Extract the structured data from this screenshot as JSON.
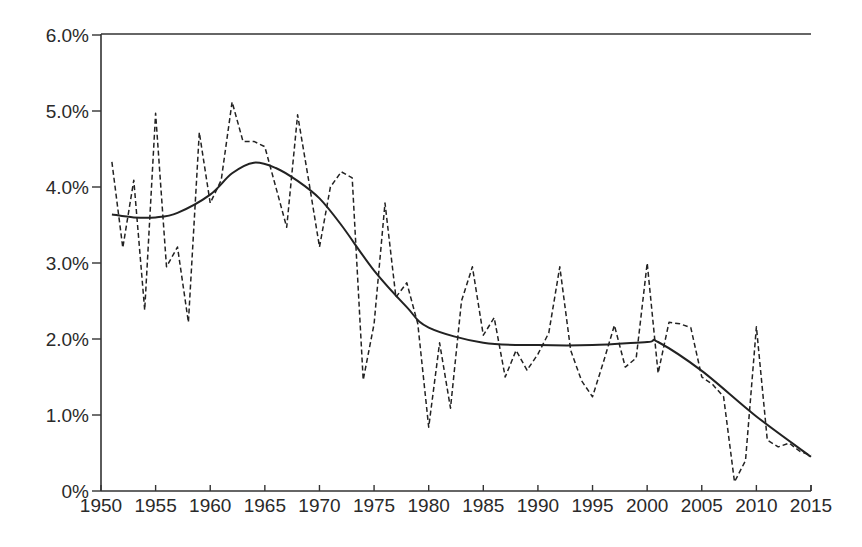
{
  "chart_data": {
    "type": "line",
    "title": "",
    "xlabel": "",
    "ylabel": "",
    "xlim": [
      1950,
      2015
    ],
    "ylim": [
      0,
      6.0
    ],
    "grid": false,
    "legend": null,
    "x_ticks": [
      1950,
      1955,
      1960,
      1965,
      1970,
      1975,
      1980,
      1985,
      1990,
      1995,
      2000,
      2005,
      2010,
      2015
    ],
    "x_tick_labels": [
      "1950",
      "1955",
      "1960",
      "1965",
      "1970",
      "1975",
      "1980",
      "1985",
      "1990",
      "1995",
      "2000",
      "2005",
      "2010",
      "2015"
    ],
    "y_ticks": [
      0,
      1,
      2,
      3,
      4,
      5,
      6
    ],
    "y_tick_labels": [
      "0%",
      "1.0%",
      "2.0%",
      "3.0%",
      "4.0%",
      "5.0%",
      "6.0%"
    ],
    "series": [
      {
        "name": "Annual value",
        "style": "dashed",
        "color": "#222222",
        "x": [
          1951,
          1952,
          1953,
          1954,
          1955,
          1956,
          1957,
          1958,
          1959,
          1960,
          1961,
          1962,
          1963,
          1964,
          1965,
          1966,
          1967,
          1968,
          1969,
          1970,
          1971,
          1972,
          1973,
          1974,
          1975,
          1976,
          1977,
          1978,
          1979,
          1980,
          1981,
          1982,
          1983,
          1984,
          1985,
          1986,
          1987,
          1988,
          1989,
          1990,
          1991,
          1992,
          1993,
          1994,
          1995,
          1996,
          1997,
          1998,
          1999,
          2000,
          2001,
          2002,
          2003,
          2004,
          2005,
          2006,
          2007,
          2008,
          2009,
          2010,
          2011,
          2012,
          2013,
          2014,
          2015
        ],
        "values": [
          4.33,
          3.2,
          4.09,
          2.38,
          4.97,
          2.95,
          3.21,
          2.22,
          4.72,
          3.79,
          4.09,
          5.12,
          4.6,
          4.6,
          4.53,
          4.0,
          3.47,
          4.95,
          4.1,
          3.21,
          4.0,
          4.2,
          4.12,
          1.46,
          2.2,
          3.79,
          2.55,
          2.74,
          2.2,
          0.84,
          1.95,
          1.09,
          2.5,
          2.95,
          2.05,
          2.28,
          1.5,
          1.85,
          1.59,
          1.8,
          2.08,
          2.95,
          1.85,
          1.45,
          1.24,
          1.7,
          2.18,
          1.63,
          1.75,
          3.0,
          1.55,
          2.22,
          2.2,
          2.15,
          1.5,
          1.4,
          1.24,
          0.12,
          0.4,
          2.16,
          0.67,
          0.58,
          0.63,
          0.52,
          0.47
        ]
      },
      {
        "name": "Trend",
        "style": "solid",
        "color": "#222222",
        "x": [
          1951,
          1953,
          1955,
          1957,
          1960,
          1962,
          1964,
          1966,
          1968,
          1970,
          1972,
          1975,
          1978,
          1980,
          1985,
          1990,
          1995,
          2000,
          2001,
          2005,
          2010,
          2015
        ],
        "values": [
          3.64,
          3.6,
          3.6,
          3.66,
          3.9,
          4.18,
          4.32,
          4.25,
          4.08,
          3.85,
          3.5,
          2.9,
          2.42,
          2.15,
          1.95,
          1.92,
          1.92,
          1.96,
          1.96,
          1.58,
          0.98,
          0.45
        ]
      }
    ]
  }
}
